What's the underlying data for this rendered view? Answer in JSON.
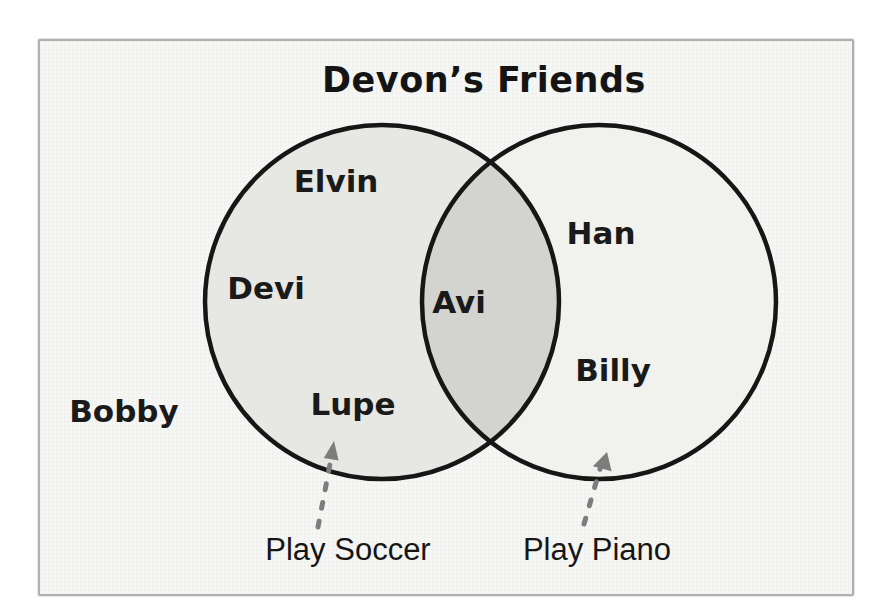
{
  "diagram": {
    "type": "venn",
    "title": "Devon’s Friends",
    "sets": [
      {
        "label": "Play Soccer",
        "members": [
          "Elvin",
          "Devi",
          "Lupe"
        ]
      },
      {
        "label": "Play Piano",
        "members": [
          "Han",
          "Billy"
        ]
      }
    ],
    "intersection_members": [
      "Avi"
    ],
    "outside_members": [
      "Bobby"
    ]
  },
  "icons": {
    "left_arrow": "dashed-arrow-up",
    "right_arrow": "dashed-arrow-up"
  },
  "colors": {
    "paper_background": "#f6f6f4",
    "paper_border": "#b0b0ae",
    "left_circle_fill": "#e7e7e4",
    "right_circle_fill": "#f1f1ee",
    "overlap_fill": "#d3d3cf",
    "circle_stroke": "#161616",
    "arrow": "#7d7d7d",
    "text": "#1a1a1a"
  }
}
